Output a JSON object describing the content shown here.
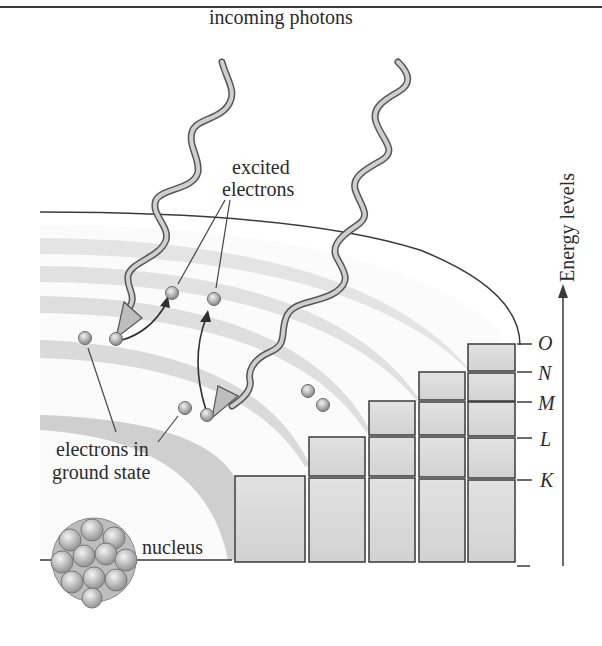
{
  "figure": {
    "labels": {
      "incoming_photons": "incoming photons",
      "excited_electrons_line1": "excited",
      "excited_electrons_line2": "electrons",
      "ground_state_line1": "electrons in",
      "ground_state_line2": "ground state",
      "nucleus": "nucleus",
      "energy_axis": "Energy levels"
    },
    "energy_levels": [
      "K",
      "L",
      "M",
      "N",
      "O"
    ],
    "colors": {
      "line": "#3a3a3a",
      "block_fill": "#d9d9d9",
      "shell_band": "#e0e0e0",
      "electron": "#a8a8a8",
      "photon": "#bdbdbd"
    }
  }
}
